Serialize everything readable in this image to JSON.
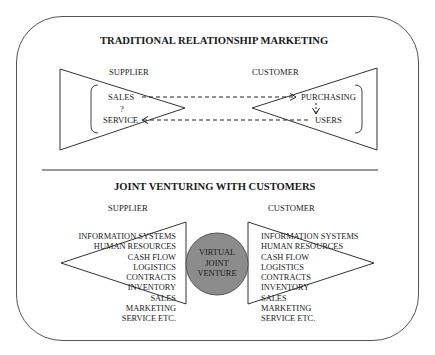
{
  "top_section": {
    "title": "TRADITIONAL RELATIONSHIP MARKETING",
    "supplier_label": "SUPPLIER",
    "customer_label": "CUSTOMER",
    "supplier_items": {
      "sales": "SALES",
      "question": "?",
      "service": "SERVICE"
    },
    "customer_items": {
      "purchasing": "PURCHASING",
      "users": "USERS"
    }
  },
  "bottom_section": {
    "title": "JOINT VENTURING WITH CUSTOMERS",
    "supplier_label": "SUPPLIER",
    "customer_label": "CUSTOMER",
    "center": {
      "line1": "VIRTUAL",
      "line2": "JOINT",
      "line3": "VENTURE",
      "fill": "#8c8c8c"
    },
    "supplier_functions": [
      "INFORMATION SYSTEMS",
      "HUMAN RESOURCES",
      "CASH FLOW",
      "LOGISTICS",
      "CONTRACTS",
      "INVENTORY",
      "SALES",
      "MARKETING",
      "SERVICE ETC."
    ],
    "customer_functions": [
      "INFORMATION SYSTEMS",
      "HUMAN RESOURCES",
      "CASH FLOW",
      "LOGISTICS",
      "CONTRACTS",
      "INVENTORY",
      "SALES",
      "MARKETING",
      "SERVICE ETC."
    ]
  }
}
